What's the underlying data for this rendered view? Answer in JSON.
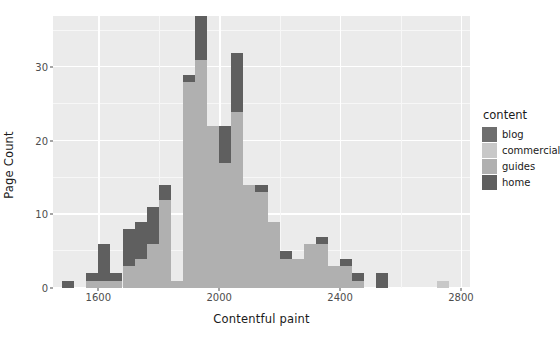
{
  "chart_data": {
    "type": "bar",
    "title": "",
    "subtitle": "",
    "xlabel": "Contentful paint",
    "ylabel": "Page Count",
    "xlim": [
      1450,
      2830
    ],
    "ylim": [
      0,
      37
    ],
    "xticks": [
      1600,
      2000,
      2400,
      2800
    ],
    "yticks": [
      0,
      10,
      20,
      30
    ],
    "xtick_labels": [
      "1600",
      "2000",
      "2400",
      "2800"
    ],
    "ytick_labels": [
      "0",
      "10",
      "20",
      "30"
    ],
    "grid": true,
    "stacked": true,
    "bin_width": 40,
    "legend": {
      "title": "content",
      "position": "right",
      "entries": [
        {
          "label": "blog",
          "color": "#6e6e6e"
        },
        {
          "label": "commercial",
          "color": "#c8c8c8"
        },
        {
          "label": "guides",
          "color": "#b0b0b0"
        },
        {
          "label": "home",
          "color": "#5f5f5f"
        }
      ]
    },
    "series": [
      {
        "name": "blog",
        "color": "#6e6e6e"
      },
      {
        "name": "commercial",
        "color": "#c8c8c8"
      },
      {
        "name": "guides",
        "color": "#b0b0b0"
      },
      {
        "name": "home",
        "color": "#5f5f5f"
      }
    ],
    "bins": [
      {
        "x0": 1480,
        "x1": 1520,
        "blog": 0,
        "commercial": 0,
        "guides": 0,
        "home": 1,
        "total": 1
      },
      {
        "x0": 1520,
        "x1": 1560,
        "blog": 0,
        "commercial": 0,
        "guides": 0,
        "home": 0,
        "total": 0
      },
      {
        "x0": 1560,
        "x1": 1600,
        "blog": 0,
        "commercial": 0,
        "guides": 1,
        "home": 1,
        "total": 2
      },
      {
        "x0": 1600,
        "x1": 1640,
        "blog": 0,
        "commercial": 0,
        "guides": 1,
        "home": 5,
        "total": 6
      },
      {
        "x0": 1640,
        "x1": 1680,
        "blog": 0,
        "commercial": 0,
        "guides": 1,
        "home": 1,
        "total": 2
      },
      {
        "x0": 1680,
        "x1": 1720,
        "blog": 0,
        "commercial": 0,
        "guides": 3,
        "home": 5,
        "total": 8
      },
      {
        "x0": 1720,
        "x1": 1760,
        "blog": 0,
        "commercial": 0,
        "guides": 4,
        "home": 5,
        "total": 9
      },
      {
        "x0": 1760,
        "x1": 1800,
        "blog": 0,
        "commercial": 0,
        "guides": 6,
        "home": 5,
        "total": 11
      },
      {
        "x0": 1800,
        "x1": 1840,
        "blog": 0,
        "commercial": 0,
        "guides": 12,
        "home": 2,
        "total": 14
      },
      {
        "x0": 1840,
        "x1": 1880,
        "blog": 0,
        "commercial": 0,
        "guides": 1,
        "home": 0,
        "total": 1
      },
      {
        "x0": 1880,
        "x1": 1920,
        "blog": 0,
        "commercial": 0,
        "guides": 28,
        "home": 1,
        "total": 29
      },
      {
        "x0": 1920,
        "x1": 1960,
        "blog": 0,
        "commercial": 0,
        "guides": 31,
        "home": 6,
        "total": 37
      },
      {
        "x0": 1960,
        "x1": 2000,
        "blog": 0,
        "commercial": 0,
        "guides": 22,
        "home": 0,
        "total": 22
      },
      {
        "x0": 2000,
        "x1": 2040,
        "blog": 0,
        "commercial": 0,
        "guides": 17,
        "home": 5,
        "total": 22
      },
      {
        "x0": 2040,
        "x1": 2080,
        "blog": 0,
        "commercial": 0,
        "guides": 24,
        "home": 8,
        "total": 32
      },
      {
        "x0": 2080,
        "x1": 2120,
        "blog": 0,
        "commercial": 0,
        "guides": 14,
        "home": 0,
        "total": 14
      },
      {
        "x0": 2120,
        "x1": 2160,
        "blog": 0,
        "commercial": 0,
        "guides": 13,
        "home": 1,
        "total": 14
      },
      {
        "x0": 2160,
        "x1": 2200,
        "blog": 0,
        "commercial": 0,
        "guides": 9,
        "home": 0,
        "total": 9
      },
      {
        "x0": 2200,
        "x1": 2240,
        "blog": 0,
        "commercial": 0,
        "guides": 4,
        "home": 1,
        "total": 5
      },
      {
        "x0": 2240,
        "x1": 2280,
        "blog": 0,
        "commercial": 0,
        "guides": 4,
        "home": 0,
        "total": 4
      },
      {
        "x0": 2280,
        "x1": 2320,
        "blog": 0,
        "commercial": 0,
        "guides": 6,
        "home": 0,
        "total": 6
      },
      {
        "x0": 2320,
        "x1": 2360,
        "blog": 0,
        "commercial": 0,
        "guides": 6,
        "home": 1,
        "total": 7
      },
      {
        "x0": 2360,
        "x1": 2400,
        "blog": 0,
        "commercial": 0,
        "guides": 3,
        "home": 0,
        "total": 3
      },
      {
        "x0": 2400,
        "x1": 2440,
        "blog": 0,
        "commercial": 0,
        "guides": 3,
        "home": 1,
        "total": 4
      },
      {
        "x0": 2440,
        "x1": 2480,
        "blog": 0,
        "commercial": 0,
        "guides": 1,
        "home": 1,
        "total": 2
      },
      {
        "x0": 2480,
        "x1": 2520,
        "blog": 0,
        "commercial": 0,
        "guides": 0,
        "home": 0,
        "total": 0
      },
      {
        "x0": 2520,
        "x1": 2560,
        "blog": 0,
        "commercial": 0,
        "guides": 0,
        "home": 2,
        "total": 2
      },
      {
        "x0": 2560,
        "x1": 2600,
        "blog": 0,
        "commercial": 0,
        "guides": 0,
        "home": 0,
        "total": 0
      },
      {
        "x0": 2600,
        "x1": 2640,
        "blog": 0,
        "commercial": 0,
        "guides": 0,
        "home": 0,
        "total": 0
      },
      {
        "x0": 2640,
        "x1": 2680,
        "blog": 0,
        "commercial": 0,
        "guides": 0,
        "home": 0,
        "total": 0
      },
      {
        "x0": 2680,
        "x1": 2720,
        "blog": 0,
        "commercial": 0,
        "guides": 0,
        "home": 0,
        "total": 0
      },
      {
        "x0": 2720,
        "x1": 2760,
        "blog": 0,
        "commercial": 1,
        "guides": 0,
        "home": 0,
        "total": 1
      }
    ]
  },
  "theme": {
    "panel_background": "#ebebeb",
    "grid_major_color": "#ffffff",
    "grid_minor_color": "#f7f7f7",
    "page_background": "#ffffff",
    "text_color": "#1a1a1a",
    "tick_color": "#4d4d4d"
  }
}
